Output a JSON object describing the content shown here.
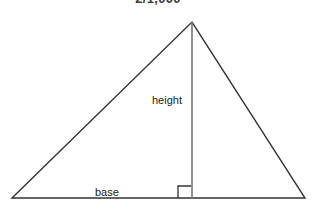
{
  "figure": {
    "title": "2/1,000",
    "shape": "triangle",
    "background_color": "#ffffff",
    "outline_color": "#333333",
    "height_line_color": "#777777",
    "labels": {
      "height": "height",
      "base": "base"
    },
    "geometry": {
      "left_vertex": [
        12,
        198
      ],
      "apex": [
        192,
        22
      ],
      "right_vertex": [
        305,
        198
      ],
      "height_foot": [
        192,
        198
      ],
      "right_angle_marker": [
        178,
        186,
        14,
        12
      ]
    }
  }
}
